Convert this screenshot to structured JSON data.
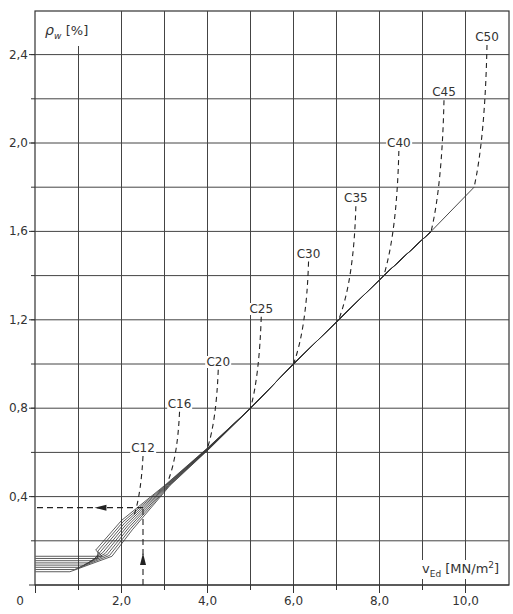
{
  "chart_data": {
    "type": "line",
    "title": "",
    "xlabel": "v_Ed [MN/m²]",
    "ylabel": "ρ_w [%]",
    "xlim": [
      0,
      11
    ],
    "ylim": [
      0,
      2.6
    ],
    "grid": true,
    "x_ticks": [
      "0",
      "2,0",
      "4,0",
      "6,0",
      "8,0",
      "10,0"
    ],
    "x_tick_values": [
      0,
      2,
      4,
      6,
      8,
      10
    ],
    "y_ticks": [
      "0,4",
      "0,8",
      "1,2",
      "1,6",
      "2,0",
      "2,4"
    ],
    "y_tick_values": [
      0.4,
      0.8,
      1.2,
      1.6,
      2.0,
      2.4
    ],
    "x_grid_step": 1.0,
    "y_grid_step": 0.2,
    "main_curve": {
      "name": "ρw envelope",
      "x": [
        0.0,
        0.8,
        1.4,
        2.0,
        2.5,
        3.0,
        4.0,
        5.0,
        6.0,
        7.0,
        8.1,
        9.2,
        10.2
      ],
      "y": [
        0.07,
        0.07,
        0.13,
        0.25,
        0.35,
        0.45,
        0.6,
        0.8,
        1.0,
        1.2,
        1.4,
        1.6,
        1.8
      ]
    },
    "plateau_lines": {
      "count": 8,
      "y_range": [
        0.06,
        0.13
      ]
    },
    "series": [
      {
        "name": "C12",
        "label_x": 2.5,
        "label_y": 0.62,
        "joins_main_at": [
          2.3,
          0.32
        ]
      },
      {
        "name": "C16",
        "label_x": 3.35,
        "label_y": 0.82,
        "joins_main_at": [
          3.1,
          0.48
        ]
      },
      {
        "name": "C20",
        "label_x": 4.25,
        "label_y": 1.01,
        "joins_main_at": [
          4.0,
          0.62
        ]
      },
      {
        "name": "C25",
        "label_x": 5.25,
        "label_y": 1.25,
        "joins_main_at": [
          5.0,
          0.8
        ]
      },
      {
        "name": "C30",
        "label_x": 6.35,
        "label_y": 1.5,
        "joins_main_at": [
          6.0,
          1.0
        ]
      },
      {
        "name": "C35",
        "label_x": 7.45,
        "label_y": 1.75,
        "joins_main_at": [
          7.05,
          1.2
        ]
      },
      {
        "name": "C40",
        "label_x": 8.45,
        "label_y": 2.0,
        "joins_main_at": [
          8.1,
          1.4
        ]
      },
      {
        "name": "C45",
        "label_x": 9.5,
        "label_y": 2.23,
        "joins_main_at": [
          9.2,
          1.6
        ]
      },
      {
        "name": "C50",
        "label_x": 10.5,
        "label_y": 2.48,
        "joins_main_at": [
          10.2,
          1.8
        ]
      }
    ],
    "example_reading": {
      "v_Ed": 2.5,
      "rho_w": 0.35,
      "description": "dashed arrow up from v_Ed=2.5 to curve, then left to ρw≈0.35"
    }
  },
  "axis": {
    "origin_label": "0",
    "y_title_symbol": "ρ",
    "y_title_sub": "w",
    "y_title_unit": "[%]",
    "x_title_symbol": "v",
    "x_title_sub": "Ed",
    "x_title_unit": "[MN/m",
    "x_title_sup": "2",
    "x_title_close": "]"
  },
  "labels": {
    "x": [
      "0",
      "2,0",
      "4,0",
      "6,0",
      "8,0",
      "10,0"
    ],
    "y": [
      "0,4",
      "0,8",
      "1,2",
      "1,6",
      "2,0",
      "2,4"
    ],
    "curves": [
      "C12",
      "C16",
      "C20",
      "C25",
      "C30",
      "C35",
      "C40",
      "C45",
      "C50"
    ]
  },
  "colors": {
    "line": "#222222",
    "grid": "#333333",
    "text": "#333333",
    "background": "#ffffff"
  }
}
